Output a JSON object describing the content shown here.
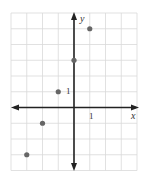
{
  "chart_data": {
    "type": "scatter",
    "title": "",
    "xlabel": "x",
    "ylabel": "y",
    "xlim": [
      -4,
      4
    ],
    "ylim": [
      -4,
      6
    ],
    "grid": true,
    "tick_labels": {
      "x": [
        "1"
      ],
      "y": [
        "1"
      ]
    },
    "series": [
      {
        "name": "points",
        "x": [
          -3,
          -2,
          -1,
          0,
          1
        ],
        "y": [
          -3,
          -1,
          1,
          3,
          5
        ]
      }
    ]
  },
  "colors": {
    "grid": "#d9d9d9",
    "axis": "#222222",
    "point": "#666666"
  }
}
